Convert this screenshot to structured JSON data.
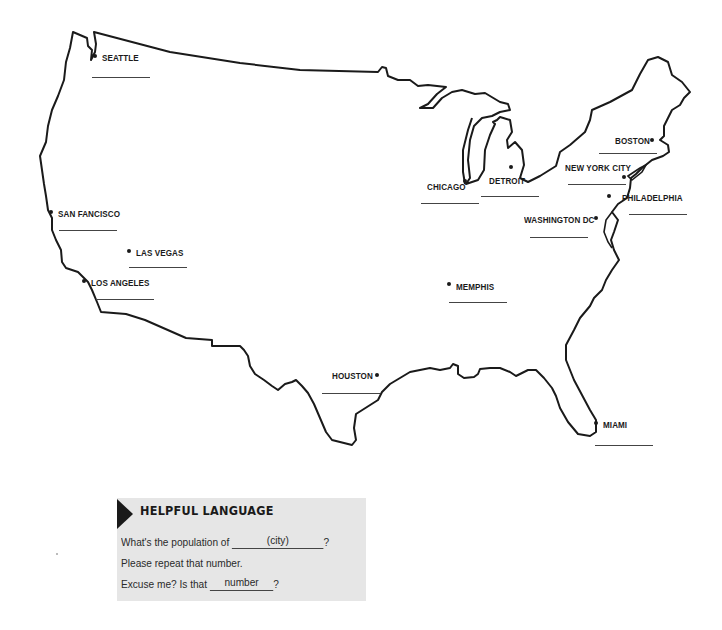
{
  "map": {
    "title": "United States outline map with city labels",
    "outline_color": "#1a1a1a",
    "cities": [
      {
        "name": "SEATTLE",
        "label_x": 102,
        "label_y": 52,
        "dot_x": 95,
        "dot_y": 56,
        "blank_x": 92,
        "blank_y": 77,
        "blank_w": 58
      },
      {
        "name": "SAN FANCISCO",
        "label_x": 58,
        "label_y": 208,
        "dot_x": 51,
        "dot_y": 212,
        "blank_x": 59,
        "blank_y": 230,
        "blank_w": 58
      },
      {
        "name": "LAS VEGAS",
        "label_x": 136,
        "label_y": 247,
        "dot_x": 129,
        "dot_y": 251,
        "blank_x": 129,
        "blank_y": 267,
        "blank_w": 58
      },
      {
        "name": "LOS ANGELES",
        "label_x": 91,
        "label_y": 277,
        "dot_x": 84,
        "dot_y": 281,
        "blank_x": 96,
        "blank_y": 299,
        "blank_w": 58
      },
      {
        "name": "CHICAGO",
        "label_x": 427,
        "label_y": 181,
        "dot_x": 465,
        "dot_y": 181,
        "blank_x": 421,
        "blank_y": 203,
        "blank_w": 58
      },
      {
        "name": "DETROIT",
        "label_x": 489,
        "label_y": 175,
        "dot_x": 511,
        "dot_y": 167,
        "blank_x": 481,
        "blank_y": 196,
        "blank_w": 58
      },
      {
        "name": "BOSTON",
        "label_x": 615,
        "label_y": 135,
        "dot_x": 652,
        "dot_y": 140,
        "blank_x": 599,
        "blank_y": 153,
        "blank_w": 58
      },
      {
        "name": "NEW YORK CITY",
        "label_x": 565,
        "label_y": 162,
        "dot_x": 624,
        "dot_y": 177,
        "blank_x": 568,
        "blank_y": 184,
        "blank_w": 58
      },
      {
        "name": "PHILADELPHIA",
        "label_x": 622,
        "label_y": 192,
        "dot_x": 609,
        "dot_y": 196,
        "blank_x": 629,
        "blank_y": 214,
        "blank_w": 58
      },
      {
        "name": "WASHINGTON DC",
        "label_x": 524,
        "label_y": 214,
        "dot_x": 596,
        "dot_y": 218,
        "blank_x": 530,
        "blank_y": 237,
        "blank_w": 58
      },
      {
        "name": "MEMPHIS",
        "label_x": 456,
        "label_y": 281,
        "dot_x": 449,
        "dot_y": 284,
        "blank_x": 449,
        "blank_y": 302,
        "blank_w": 58
      },
      {
        "name": "HOUSTON",
        "label_x": 332,
        "label_y": 370,
        "dot_x": 377,
        "dot_y": 375,
        "blank_x": 322,
        "blank_y": 393,
        "blank_w": 58
      },
      {
        "name": "MIAMI",
        "label_x": 603,
        "label_y": 419,
        "dot_x": 596,
        "dot_y": 423,
        "blank_x": 595,
        "blank_y": 445,
        "blank_w": 58
      }
    ]
  },
  "helpful_language": {
    "title": "HELPFUL LANGUAGE",
    "lines": [
      {
        "prefix": "What's the population of ",
        "blank_value": "(city)",
        "suffix": "?"
      },
      {
        "prefix": "Please repeat that number.",
        "blank_value": null,
        "suffix": ""
      },
      {
        "prefix": "Excuse me? Is that ",
        "blank_value": "number",
        "suffix": "?"
      }
    ],
    "background": "#e6e6e6"
  }
}
